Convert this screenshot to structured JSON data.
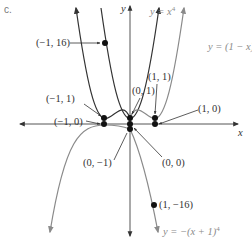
{
  "figure": {
    "panel_label": "c.",
    "axes": {
      "x_label": "x",
      "y_label": "y"
    },
    "curves": [
      {
        "id": "x4",
        "label": "y = x",
        "exponent": "4",
        "color": "#333333"
      },
      {
        "id": "one_minus_x4",
        "label": "y = (1 − x)",
        "exponent": "4",
        "color": "#8a8a8a"
      },
      {
        "id": "x_plus_1_4",
        "label": "",
        "color": "#333333"
      },
      {
        "id": "neg_x4",
        "label": "",
        "color": "#8a8a8a"
      },
      {
        "id": "neg_x_plus_1_4",
        "label": "y = −(x + 1)",
        "exponent": "4",
        "color": "#8a8a8a"
      }
    ],
    "points": [
      {
        "label": "(−1, 16)",
        "x": -1,
        "y": 16
      },
      {
        "label": "(−1, 1)",
        "x": -1,
        "y": 1
      },
      {
        "label": "(−1, 0)",
        "x": -1,
        "y": 0
      },
      {
        "label": "(0, 1)",
        "x": 0,
        "y": 1
      },
      {
        "label": "(1, 1)",
        "x": 1,
        "y": 1
      },
      {
        "label": "(1, 0)",
        "x": 1,
        "y": 0
      },
      {
        "label": "(0, −1)",
        "x": 0,
        "y": -1
      },
      {
        "label": "(0, 0)",
        "x": 0,
        "y": 0
      },
      {
        "label": "(1, −16)",
        "x": 1,
        "y": -16
      }
    ]
  }
}
